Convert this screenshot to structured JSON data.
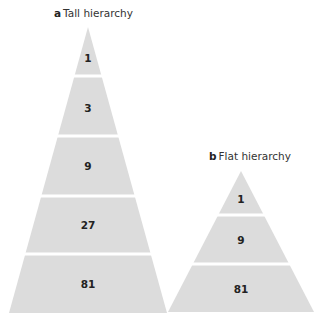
{
  "tall": {
    "letter": "a",
    "title": "Tall hierarchy",
    "levels": [
      "1",
      "3",
      "9",
      "27",
      "81"
    ]
  },
  "flat": {
    "letter": "b",
    "title": "Flat hierarchy",
    "levels": [
      "1",
      "9",
      "81"
    ]
  },
  "colors": {
    "fill": "#dcdcdc",
    "divider": "#ffffff",
    "text": "#222222"
  }
}
